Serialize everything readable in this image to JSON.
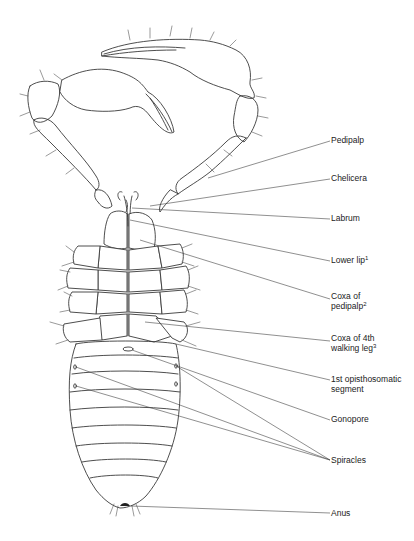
{
  "figure": {
    "labels": [
      {
        "id": "pedipalp",
        "text": "Pedipalp",
        "sup": "",
        "x": 331,
        "y": 137,
        "lines": [
          "Pedipalp"
        ],
        "target": [
          205,
          185
        ]
      },
      {
        "id": "chelicera",
        "text": "Chelicera",
        "sup": "",
        "x": 331,
        "y": 175,
        "lines": [
          "Chelicera"
        ],
        "target": [
          150,
          203
        ]
      },
      {
        "id": "labrum",
        "text": "Labrum",
        "sup": "",
        "x": 331,
        "y": 215,
        "lines": [
          "Labrum"
        ],
        "target": [
          135,
          208
        ]
      },
      {
        "id": "lower-lip",
        "text": "Lower lip",
        "sup": "1",
        "x": 331,
        "y": 257,
        "lines": [
          "Lower lip"
        ],
        "target": [
          130,
          220
        ]
      },
      {
        "id": "coxa-pedipalp",
        "text": "Coxa of pedipalp",
        "sup": "2",
        "x": 331,
        "y": 295,
        "lines": [
          "Coxa of",
          "pedipalp"
        ],
        "target": [
          140,
          240
        ]
      },
      {
        "id": "coxa-4th-leg",
        "text": "Coxa of 4th walking leg",
        "sup": "3",
        "x": 331,
        "y": 337,
        "lines": [
          "Coxa of 4th",
          "walking leg"
        ],
        "target": [
          145,
          320
        ]
      },
      {
        "id": "opisthosomatic",
        "text": "1st opisthosomatic segment",
        "sup": "",
        "x": 331,
        "y": 376,
        "lines": [
          "1st opisthosomatic",
          "segment"
        ],
        "target": [
          175,
          344
        ]
      },
      {
        "id": "gonopore",
        "text": "Gonopore",
        "sup": "",
        "x": 331,
        "y": 416,
        "lines": [
          "Gonopore"
        ],
        "target": [
          130,
          349
        ]
      },
      {
        "id": "spiracles",
        "text": "Spiracles",
        "sup": "",
        "x": 331,
        "y": 456,
        "lines": [
          "Spiracles"
        ],
        "targets": [
          [
            75,
            367
          ],
          [
            75,
            386
          ],
          [
            176,
            366
          ]
        ]
      },
      {
        "id": "anus",
        "text": "Anus",
        "sup": "",
        "x": 331,
        "y": 509,
        "lines": [
          "Anus"
        ],
        "target": [
          130,
          506
        ]
      }
    ]
  }
}
